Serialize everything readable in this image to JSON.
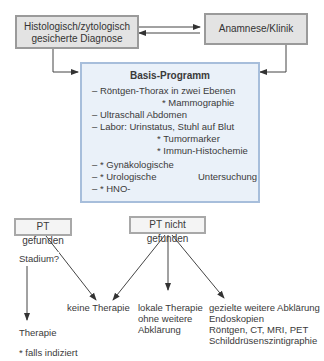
{
  "top": {
    "left_box": [
      "Histologisch/zytologisch",
      "gesicherte Diagnose"
    ],
    "right_box": "Anamnese/Klinik"
  },
  "basis": {
    "title": "Basis-Programm",
    "lines": [
      "– Röntgen-Thorax in zwei Ebenen",
      "* Mammographie",
      "– Ultraschall Abdomen",
      "– Labor: Urinstatus, Stuhl auf Blut",
      "* Tumormarker",
      "* Immun-Histochemie",
      "– * Gynäkologische",
      "– * Urologische",
      "– * HNO-",
      "Untersuchung"
    ]
  },
  "branches": {
    "pt_found": "PT gefunden",
    "pt_not_found": "PT nicht gefunden",
    "stadium": "Stadium?",
    "therapie": "Therapie",
    "keine_therapie": "keine Therapie",
    "lokale": [
      "lokale Therapie",
      "ohne weitere",
      "Abklärung"
    ],
    "gezielte": [
      "gezielte weitere Abklärung",
      "Endoskopien",
      "Röntgen, CT, MRI, PET",
      "Schilddrüsenszintigraphie"
    ]
  },
  "footnote": "* falls indiziert"
}
